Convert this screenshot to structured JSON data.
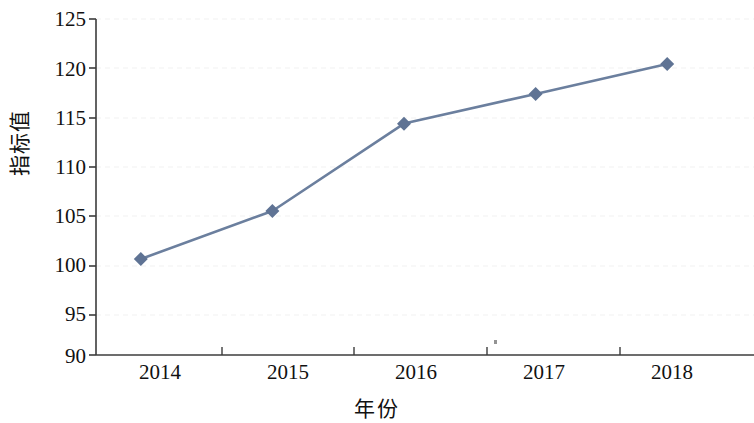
{
  "chart_data": {
    "type": "line",
    "title": "",
    "subtitle": "",
    "xlabel": "年份",
    "ylabel": "指标值",
    "categories": [
      "2014",
      "2015",
      "2016",
      "2017",
      "2018"
    ],
    "values": [
      100.0,
      105.0,
      114.1,
      117.2,
      120.3
    ],
    "series": [
      {
        "name": "指标值",
        "values": [
          100.0,
          105.0,
          114.1,
          117.2,
          120.3
        ]
      }
    ],
    "ylim": [
      90,
      125
    ],
    "y_ticks": [
      90,
      95,
      100,
      105,
      110,
      115,
      120,
      125
    ],
    "y_tick_labels": [
      "90",
      "95",
      "100",
      "105",
      "110",
      "115",
      "120",
      "125"
    ],
    "y_tick_step": 5,
    "x_tick_labels": [
      "2014",
      "2015",
      "2016",
      "2017",
      "2018"
    ],
    "grid": "horizontal-dashed-faint",
    "legend": "none",
    "annotations": [],
    "colors": {
      "line": "#6b7f9e",
      "marker": "#5f7394",
      "axis": "#3c3c3c",
      "grid": "#f0f0f0",
      "text": "#111111",
      "background": "#ffffff"
    }
  }
}
